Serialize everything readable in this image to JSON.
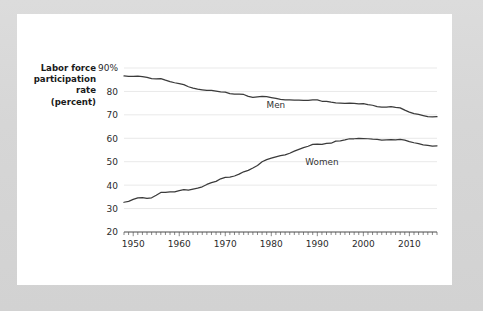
{
  "figure": {
    "background_color": "#d8d8d8",
    "card_color": "#ffffff",
    "line_color": "#3b3b3b",
    "grid_color": "#e9e9e9",
    "axis_color": "#4a4a4a"
  },
  "chart_data": {
    "type": "line",
    "title": "",
    "subtitle": "",
    "xlabel": "",
    "ylabel": "Labor force participation rate (percent)",
    "ylabel_lines": [
      "Labor force",
      "participation",
      "rate",
      "(percent)"
    ],
    "ylim": [
      20,
      90
    ],
    "xlim": [
      1948,
      2016
    ],
    "yticks": [
      20,
      30,
      40,
      50,
      60,
      70,
      80,
      90
    ],
    "yticklabels": [
      "20",
      "30",
      "40",
      "50",
      "60",
      "70",
      "80",
      "90%"
    ],
    "xticks": [
      1950,
      1960,
      1970,
      1980,
      1990,
      2000,
      2010
    ],
    "xticklabels": [
      "1950",
      "1960",
      "1970",
      "1980",
      "1990",
      "2000",
      "2010"
    ],
    "minor_xtick_interval": 1,
    "grid": "horizontal",
    "legend": "inline-labels",
    "annotations": [
      {
        "text": "Men",
        "x": 1981,
        "y": 73.0
      },
      {
        "text": "Women",
        "x": 1991,
        "y": 48.5
      }
    ],
    "series": [
      {
        "name": "Men",
        "label": "Men",
        "x": [
          1948,
          1949,
          1950,
          1951,
          1952,
          1953,
          1954,
          1955,
          1956,
          1957,
          1958,
          1959,
          1960,
          1961,
          1962,
          1963,
          1964,
          1965,
          1966,
          1967,
          1968,
          1969,
          1970,
          1971,
          1972,
          1973,
          1974,
          1975,
          1976,
          1977,
          1978,
          1979,
          1980,
          1981,
          1982,
          1983,
          1984,
          1985,
          1986,
          1987,
          1988,
          1989,
          1990,
          1991,
          1992,
          1993,
          1994,
          1995,
          1996,
          1997,
          1998,
          1999,
          2000,
          2001,
          2002,
          2003,
          2004,
          2005,
          2006,
          2007,
          2008,
          2009,
          2010,
          2011,
          2012,
          2013,
          2014,
          2015,
          2016
        ],
        "values": [
          86.6,
          86.4,
          86.4,
          86.5,
          86.3,
          86.0,
          85.5,
          85.4,
          85.5,
          84.8,
          84.2,
          83.7,
          83.3,
          82.9,
          82.0,
          81.4,
          81.0,
          80.7,
          80.4,
          80.4,
          80.1,
          79.8,
          79.7,
          79.1,
          78.9,
          78.8,
          78.7,
          77.9,
          77.5,
          77.7,
          77.9,
          77.8,
          77.4,
          77.0,
          76.6,
          76.4,
          76.4,
          76.3,
          76.3,
          76.2,
          76.2,
          76.4,
          76.4,
          75.8,
          75.8,
          75.4,
          75.1,
          75.0,
          74.9,
          75.0,
          74.9,
          74.7,
          74.8,
          74.4,
          74.1,
          73.5,
          73.3,
          73.3,
          73.5,
          73.2,
          73.0,
          72.0,
          71.2,
          70.5,
          70.2,
          69.7,
          69.2,
          69.1,
          69.2
        ]
      },
      {
        "name": "Women",
        "label": "Women",
        "x": [
          1948,
          1949,
          1950,
          1951,
          1952,
          1953,
          1954,
          1955,
          1956,
          1957,
          1958,
          1959,
          1960,
          1961,
          1962,
          1963,
          1964,
          1965,
          1966,
          1967,
          1968,
          1969,
          1970,
          1971,
          1972,
          1973,
          1974,
          1975,
          1976,
          1977,
          1978,
          1979,
          1980,
          1981,
          1982,
          1983,
          1984,
          1985,
          1986,
          1987,
          1988,
          1989,
          1990,
          1991,
          1992,
          1993,
          1994,
          1995,
          1996,
          1997,
          1998,
          1999,
          2000,
          2001,
          2002,
          2003,
          2004,
          2005,
          2006,
          2007,
          2008,
          2009,
          2010,
          2011,
          2012,
          2013,
          2014,
          2015,
          2016
        ],
        "values": [
          32.7,
          33.1,
          33.9,
          34.6,
          34.7,
          34.4,
          34.6,
          35.7,
          36.9,
          36.9,
          37.1,
          37.1,
          37.7,
          38.1,
          37.9,
          38.3,
          38.7,
          39.3,
          40.3,
          41.1,
          41.6,
          42.7,
          43.3,
          43.4,
          43.9,
          44.7,
          45.7,
          46.3,
          47.3,
          48.4,
          50.0,
          50.9,
          51.5,
          52.1,
          52.6,
          52.9,
          53.6,
          54.5,
          55.3,
          56.0,
          56.6,
          57.4,
          57.5,
          57.4,
          57.8,
          57.9,
          58.8,
          58.9,
          59.3,
          59.8,
          59.8,
          60.0,
          59.9,
          59.8,
          59.6,
          59.5,
          59.2,
          59.3,
          59.4,
          59.3,
          59.5,
          59.2,
          58.6,
          58.1,
          57.7,
          57.2,
          57.0,
          56.7,
          56.8
        ]
      }
    ]
  }
}
